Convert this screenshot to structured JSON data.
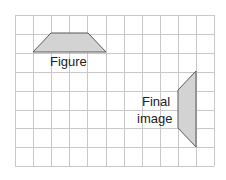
{
  "grid": {
    "origin": [
      15,
      15
    ],
    "columns": 11,
    "rows": 8,
    "cell_width": 18.1,
    "cell_height": 18.9,
    "line_color": "#c8c8c8",
    "border_color": "#c4c4c4"
  },
  "shapes": {
    "fill_color": "#d3d3d3",
    "stroke_color": "#5a5a5a",
    "figure": {
      "name": "Figure",
      "points": [
        [
          33,
          52
        ],
        [
          51,
          33
        ],
        [
          88,
          33
        ],
        [
          106,
          52
        ]
      ]
    },
    "final_image": {
      "name": "Final image",
      "points": [
        [
          196,
          71
        ],
        [
          196,
          147
        ],
        [
          178,
          128
        ],
        [
          178,
          90
        ]
      ]
    }
  },
  "labels": {
    "figure": "Figure",
    "final_line1": "Final",
    "final_line2": "image"
  }
}
